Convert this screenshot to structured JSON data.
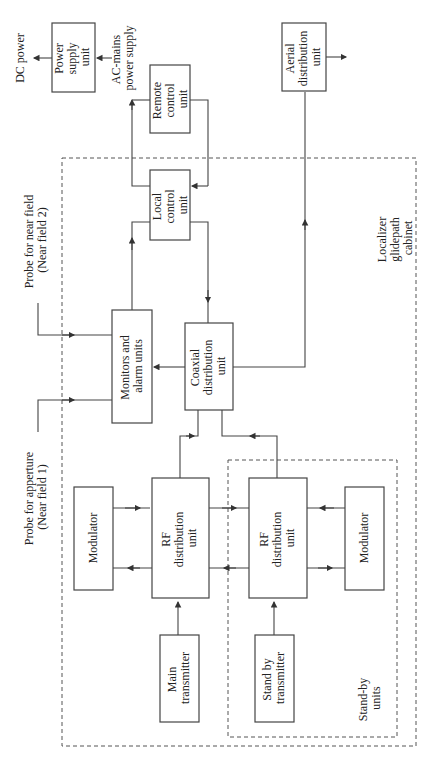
{
  "diagram": {
    "blocks": {
      "power_supply": [
        "Power",
        "supply",
        "unit"
      ],
      "remote_control": [
        "Remote",
        "control",
        "unit"
      ],
      "aerial_distribution": [
        "Aerial",
        "distribution",
        "unit"
      ],
      "local_control": [
        "Local",
        "control",
        "unit"
      ],
      "monitors": [
        "Monitors and",
        "alarm units"
      ],
      "coaxial": [
        "Coaxial",
        "distribution",
        "unit"
      ],
      "modulator_main": [
        "Modulator"
      ],
      "rf_main": [
        "RF",
        "distribution",
        "unit"
      ],
      "main_tx": [
        "Main",
        "transmitter"
      ],
      "rf_standby": [
        "RF",
        "distribution",
        "unit"
      ],
      "modulator_standby": [
        "Modulator"
      ],
      "standby_tx": [
        "Stand by",
        "transmitter"
      ]
    },
    "labels": {
      "dc_power": "DC power",
      "ac_mains": [
        "AC-mains",
        "power supply"
      ],
      "probe_near_field_2": [
        "Probe for near field",
        "(Near field 2)"
      ],
      "probe_aperture": [
        "Probe for apperture",
        "(Near field 1)"
      ],
      "cabinet": [
        "Localizer",
        "glidepath",
        "cabinet"
      ],
      "standby_units": [
        "Stand-by",
        "units"
      ]
    },
    "groups": [
      {
        "name": "Localizer glidepath cabinet",
        "style": "dashed"
      },
      {
        "name": "Stand-by units",
        "style": "dashed"
      }
    ],
    "connections": [
      {
        "from": "AC-mains power supply",
        "to": "Power supply unit"
      },
      {
        "from": "Power supply unit",
        "to": "DC power"
      },
      {
        "from": "Local control unit",
        "to": "Remote control unit"
      },
      {
        "from": "Remote control unit",
        "to": "Local control unit"
      },
      {
        "from": "Monitors and alarm units",
        "to": "Local control unit"
      },
      {
        "from": "Local control unit",
        "to": "Coaxial distribution unit"
      },
      {
        "from": "Probe for near field (Near field 2)",
        "to": "Monitors and alarm units"
      },
      {
        "from": "Probe for apperture (Near field 1)",
        "to": "Monitors and alarm units"
      },
      {
        "from": "Coaxial distribution unit",
        "to": "Monitors and alarm units"
      },
      {
        "from": "Coaxial distribution unit",
        "to": "Aerial distribution unit"
      },
      {
        "from": "Aerial distribution unit",
        "to": "output"
      },
      {
        "from": "RF distribution unit (main)",
        "to": "Coaxial distribution unit"
      },
      {
        "from": "RF distribution unit (standby)",
        "to": "Coaxial distribution unit"
      },
      {
        "from": "Modulator (main)",
        "to": "RF distribution unit (main)"
      },
      {
        "from": "RF distribution unit (main)",
        "to": "Modulator (main)"
      },
      {
        "from": "Main transmitter",
        "to": "RF distribution unit (main)"
      },
      {
        "from": "RF distribution unit (main)",
        "to": "RF distribution unit (standby)"
      },
      {
        "from": "RF distribution unit (standby)",
        "to": "RF distribution unit (main)"
      },
      {
        "from": "Modulator (standby)",
        "to": "RF distribution unit (standby)"
      },
      {
        "from": "RF distribution unit (standby)",
        "to": "Modulator (standby)"
      },
      {
        "from": "Stand by transmitter",
        "to": "RF distribution unit (standby)"
      }
    ]
  }
}
